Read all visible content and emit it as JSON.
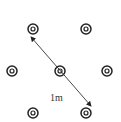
{
  "diagram": {
    "type": "hexagonal-grid-points",
    "label": "1m",
    "nodes": [
      {
        "x": 33,
        "y": 29
      },
      {
        "x": 86,
        "y": 29
      },
      {
        "x": 12,
        "y": 71
      },
      {
        "x": 60,
        "y": 71
      },
      {
        "x": 107,
        "y": 71
      },
      {
        "x": 33,
        "y": 113
      },
      {
        "x": 86,
        "y": 113
      }
    ],
    "arrow": {
      "x1": 31,
      "y1": 37,
      "x2": 91,
      "y2": 106,
      "double_headed": true
    },
    "colors": {
      "stroke": "#222222",
      "background": "#ffffff"
    }
  }
}
